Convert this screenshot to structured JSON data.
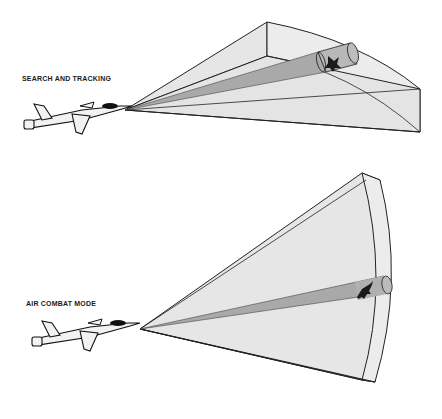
{
  "diagram": {
    "panels": [
      {
        "id": "search-and-tracking",
        "label": "SEARCH AND TRACKING",
        "description": "Wide horizontal radar scan volume with a narrow tracking beam toward a target aircraft"
      },
      {
        "id": "air-combat-mode",
        "label": "AIR COMBAT MODE",
        "description": "Tall vertical radar scan volume with a narrow beam locked on a target aircraft"
      }
    ],
    "colors": {
      "volume_fill": "#e8e8e8",
      "volume_side": "#dcdcdc",
      "beam_fill": "#a9a9a9",
      "outline": "#222222",
      "background": "#ffffff"
    }
  }
}
